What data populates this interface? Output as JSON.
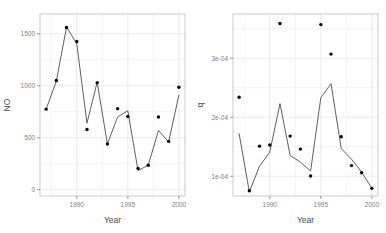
{
  "figure": {
    "type": "multi-panel-scatter-line",
    "panel_count": 2,
    "background": "#ffffff",
    "panel_bg": "#ffffff",
    "grid_color": "#ebebeb",
    "line_color": "#4d4d4d",
    "point_color": "#000000",
    "axis_color": "#808080"
  },
  "chart_data": [
    {
      "id": "panel-no",
      "type": "scatter",
      "title": "",
      "xlabel": "Year",
      "ylabel": "NO",
      "xlim": [
        1986.4,
        2000.6
      ],
      "ylim": [
        -60,
        1690
      ],
      "xticks": [
        1990,
        1995,
        2000
      ],
      "xticklabels": [
        "1990",
        "1995",
        "2000"
      ],
      "yticks": [
        0,
        500,
        1000,
        1500
      ],
      "yticklabels": [
        "0",
        "500",
        "1000",
        "1500"
      ],
      "grid": true,
      "legend": "none",
      "x": [
        1987,
        1988,
        1989,
        1990,
        1991,
        1992,
        1993,
        1994,
        1995,
        1996,
        1997,
        1998,
        1999,
        2000
      ],
      "series": [
        {
          "name": "observed",
          "style": "points",
          "values": [
            775,
            1050,
            1560,
            1425,
            580,
            1030,
            440,
            780,
            705,
            205,
            235,
            700,
            465,
            985
          ]
        },
        {
          "name": "fitted",
          "style": "line",
          "values": [
            775,
            1045,
            1565,
            1405,
            640,
            1035,
            440,
            700,
            760,
            185,
            235,
            570,
            460,
            910
          ]
        }
      ]
    },
    {
      "id": "panel-q",
      "type": "scatter",
      "title": "",
      "xlabel": "Year",
      "ylabel": "q",
      "xlim": [
        1986.4,
        2000.6
      ],
      "ylim": [
        6.65e-05,
        0.000375
      ],
      "xticks": [
        1990,
        1995,
        2000
      ],
      "xticklabels": [
        "1990",
        "1995",
        "2000"
      ],
      "yticks": [
        0.0001,
        0.0002,
        0.0003
      ],
      "yticklabels": [
        "1e-04",
        "2e-04",
        "3e-04"
      ],
      "grid": true,
      "legend": "none",
      "x": [
        1987,
        1988,
        1989,
        1990,
        1991,
        1992,
        1993,
        1994,
        1995,
        1996,
        1997,
        1998,
        1999,
        2000
      ],
      "series": [
        {
          "name": "observed",
          "style": "points",
          "values": [
            0.000234,
            7.55e-05,
            0.000151,
            0.000153,
            0.000359,
            0.000168,
            0.000146,
            0.0001005,
            0.000357,
            0.000307,
            0.000167,
            0.000118,
            0.000106,
            7.95e-05
          ]
        },
        {
          "name": "fitted",
          "style": "line",
          "values": [
            0.000172,
            7.35e-05,
            0.000117,
            0.000141,
            0.000223,
            0.000135,
            0.000124,
            0.000109,
            0.000233,
            0.000257,
            0.000147,
            0.000129,
            0.000107,
            7.95e-05
          ]
        }
      ]
    }
  ]
}
